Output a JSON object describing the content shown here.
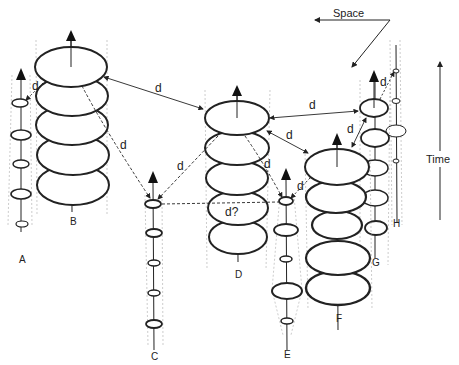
{
  "diagram": {
    "axis_labels": {
      "space": "Space",
      "time": "Time"
    },
    "stacks": [
      {
        "id": "A",
        "label": "A"
      },
      {
        "id": "B",
        "label": "B"
      },
      {
        "id": "C",
        "label": "C"
      },
      {
        "id": "D",
        "label": "D"
      },
      {
        "id": "E",
        "label": "E"
      },
      {
        "id": "F",
        "label": "F"
      },
      {
        "id": "G",
        "label": "G"
      },
      {
        "id": "H",
        "label": "H"
      }
    ],
    "distance_labels": {
      "d_b_a": "d",
      "d_b_d": "d",
      "d_b_c": "d",
      "d_d_c": "d",
      "d_d_e": "d",
      "d_d_f": "d",
      "d_d_g": "d",
      "d_f_g": "d",
      "d_g_h": "d",
      "d_f_e": "d",
      "d_c_e": "d?"
    },
    "colors": {
      "ink": "#222222",
      "guide": "#9a9a9a",
      "background": "#ffffff"
    }
  }
}
